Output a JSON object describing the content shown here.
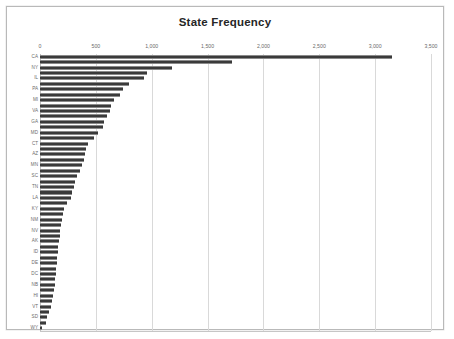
{
  "chart": {
    "title": "State Frequency",
    "frame_border_color": "#b9b9b9",
    "bar_color": "#3a3a3a",
    "gridline_color": "#d9d9d9",
    "background": "#ffffff"
  },
  "chart_data": {
    "type": "bar",
    "orientation": "horizontal",
    "title": "State Frequency",
    "xlabel": "",
    "ylabel": "",
    "xlim": [
      0,
      3500
    ],
    "xticks": [
      0,
      500,
      1000,
      1500,
      2000,
      2500,
      3000,
      3500
    ],
    "xtick_labels": [
      "0",
      "500",
      "1,000",
      "1,500",
      "2,000",
      "2,500",
      "3,000",
      "3,500"
    ],
    "grid": true,
    "grid_axis": "x",
    "legend": false,
    "y_label_interval": 2,
    "categories": [
      "CA",
      "TX",
      "NY",
      "FL",
      "IL",
      "OH",
      "PA",
      "NJ",
      "MI",
      "NC",
      "VA",
      "MA",
      "GA",
      "WA",
      "MD",
      "IN",
      "CT",
      "MO",
      "AZ",
      "CO",
      "MN",
      "WI",
      "SC",
      "AL",
      "TN",
      "OR",
      "LA",
      "OK",
      "KY",
      "KS",
      "NM",
      "AR",
      "NV",
      "UT",
      "AK",
      "NE",
      "ID",
      "WV",
      "DE",
      "NH",
      "DC",
      "ME",
      "NB",
      "RI",
      "HI",
      "MT",
      "VT",
      "ND",
      "SD",
      "IA",
      "WY"
    ],
    "values": [
      3150,
      1720,
      1180,
      960,
      930,
      800,
      740,
      720,
      660,
      640,
      625,
      600,
      570,
      560,
      520,
      480,
      430,
      415,
      405,
      395,
      375,
      355,
      330,
      315,
      300,
      290,
      280,
      245,
      215,
      205,
      195,
      190,
      180,
      175,
      170,
      165,
      160,
      155,
      150,
      145,
      140,
      135,
      130,
      125,
      118,
      110,
      95,
      80,
      65,
      50,
      18
    ]
  }
}
